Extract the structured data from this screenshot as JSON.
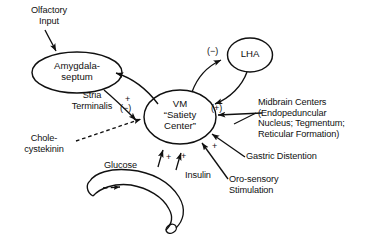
{
  "figure": {
    "kind": "neuroanatomical-flow-diagram",
    "background_color": "#ffffff",
    "stroke_color": "#101010"
  },
  "nodes": {
    "amygdala": {
      "label": "Amygdala-\nseptum",
      "shape": "ellipse"
    },
    "vm": {
      "label": "VM\n“Satiety\nCenter”",
      "shape": "ellipse"
    },
    "lha": {
      "label": "LHA",
      "shape": "ellipse"
    },
    "gut": {
      "label": "",
      "shape": "curved-tube"
    }
  },
  "labels": {
    "olfactory_input": "Olfactory\nInput",
    "stria_terminalis": "Stria\nTerminalis",
    "cholecystekinin": "Chole-\ncystekinin",
    "glucose": "Glucose",
    "insulin": "Insulin",
    "midbrain_centers": "Midbrain Centers\n(Endopeduncular\nNucleus; Tegmentum;\nReticular Formation)",
    "gastric_distention": "Gastric Distention",
    "oro_sensory": "Oro-sensory\nStimulation"
  },
  "signs": {
    "amyg_to_vm_plus": "+",
    "amyg_to_vm_minus": "(−)",
    "vm_to_lha_minus": "(−)",
    "lha_to_vm_plus": "(+)",
    "gastric_plus": "+",
    "glucose_plus": "+",
    "insulin_plus": "+"
  },
  "edges": [
    {
      "from": "olfactory_input",
      "to": "amygdala",
      "style": "solid-arrow",
      "sign": ""
    },
    {
      "from": "amygdala",
      "to": "vm",
      "style": "solid-arrow",
      "sign": "+ / (−)",
      "pathway": "Stria Terminalis"
    },
    {
      "from": "vm",
      "to": "amygdala",
      "style": "solid-arrow",
      "sign": ""
    },
    {
      "from": "vm",
      "to": "lha",
      "style": "solid-arrow",
      "sign": "(−)"
    },
    {
      "from": "lha",
      "to": "vm",
      "style": "solid-arrow",
      "sign": "(+)"
    },
    {
      "from": "cholecystekinin",
      "to": "vm",
      "style": "dashed-arrow",
      "sign": ""
    },
    {
      "from": "glucose",
      "to": "vm",
      "style": "solid-arrow",
      "sign": "+"
    },
    {
      "from": "insulin",
      "to": "vm",
      "style": "solid-arrow",
      "sign": "+"
    },
    {
      "from": "midbrain_centers",
      "to": "vm",
      "style": "solid-arrow",
      "sign": ""
    },
    {
      "from": "gastric_distention",
      "to": "vm",
      "style": "solid-arrow",
      "sign": "+"
    },
    {
      "from": "oro_sensory",
      "to": "vm",
      "style": "solid-arrow",
      "sign": ""
    }
  ]
}
